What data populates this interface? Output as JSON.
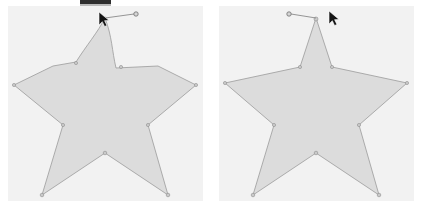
{
  "app": {
    "title": "Shape Editor Comparison",
    "panel_count": 2
  },
  "top_bar": {
    "name": "toolbar-strip",
    "color": "#2e2e2e",
    "label": ""
  },
  "colors": {
    "canvas_background": "#f2f2f2",
    "page_background": "#ffffff",
    "shape_fill": "#dcdcdc",
    "shape_stroke": "#9a9a9a",
    "vertex_fill": "#c9c9c9",
    "vertex_stroke": "#8e8e8e",
    "handle_stroke": "#8a8a8a",
    "cursor_fill": "#141414",
    "toolbar_dark": "#2e2e2e"
  },
  "panels": [
    {
      "id": "left",
      "name": "canvas-left",
      "label": "Before",
      "x": 8,
      "y": 6,
      "width": 195,
      "height": 195,
      "shape": {
        "name": "star-polygon",
        "type": "star",
        "points": 5,
        "top_point_style": "rounded",
        "fill": "#dcdcdc",
        "stroke": "#9a9a9a",
        "path": "M 97 12 C 104 30 104 45 108 62 L 150 60 L 188 79 L 140 119 L 160 189 L 97 147 L 34 189 L 55 119 L 6 79 L 45 60 L 68 56 C 78 40 90 26 97 12 Z",
        "vertices": [
          {
            "name": "vertex-top",
            "x": 97,
            "y": 13
          },
          {
            "name": "vertex-inner-upper-right",
            "x": 113,
            "y": 61
          },
          {
            "name": "vertex-outer-right",
            "x": 188,
            "y": 79
          },
          {
            "name": "vertex-inner-lower-right",
            "x": 140,
            "y": 119
          },
          {
            "name": "vertex-outer-bottom-right",
            "x": 160,
            "y": 189
          },
          {
            "name": "vertex-inner-bottom",
            "x": 97,
            "y": 147
          },
          {
            "name": "vertex-outer-bottom-left",
            "x": 34,
            "y": 189
          },
          {
            "name": "vertex-inner-lower-left",
            "x": 55,
            "y": 119
          },
          {
            "name": "vertex-outer-left",
            "x": 6,
            "y": 79
          },
          {
            "name": "vertex-inner-upper-left",
            "x": 68,
            "y": 57
          }
        ]
      },
      "rotation_handle": {
        "name": "rotation-handle-left",
        "direction": "right",
        "anchor_x": 97,
        "anchor_y": 12,
        "end_x": 128,
        "end_y": 8
      },
      "cursor": {
        "name": "rotate-cursor",
        "x": 95,
        "y": 10,
        "glyph": "arrow-pointer"
      }
    },
    {
      "id": "right",
      "name": "canvas-right",
      "label": "After",
      "x": 219,
      "y": 6,
      "width": 195,
      "height": 195,
      "shape": {
        "name": "star-polygon",
        "type": "star",
        "points": 5,
        "top_point_style": "sharp",
        "fill": "#dcdcdc",
        "stroke": "#9a9a9a",
        "path": "M 97 12 L 113 61 L 188 77 L 140 119 L 160 189 L 97 147 L 34 189 L 55 119 L 6 77 L 81 61 Z",
        "vertices": [
          {
            "name": "vertex-top",
            "x": 97,
            "y": 13
          },
          {
            "name": "vertex-inner-upper-right",
            "x": 113,
            "y": 61
          },
          {
            "name": "vertex-outer-right",
            "x": 188,
            "y": 77
          },
          {
            "name": "vertex-inner-lower-right",
            "x": 140,
            "y": 119
          },
          {
            "name": "vertex-outer-bottom-right",
            "x": 160,
            "y": 189
          },
          {
            "name": "vertex-inner-bottom",
            "x": 97,
            "y": 147
          },
          {
            "name": "vertex-outer-bottom-left",
            "x": 34,
            "y": 189
          },
          {
            "name": "vertex-inner-lower-left",
            "x": 55,
            "y": 119
          },
          {
            "name": "vertex-outer-left",
            "x": 6,
            "y": 77
          },
          {
            "name": "vertex-inner-upper-left",
            "x": 81,
            "y": 61
          }
        ]
      },
      "rotation_handle": {
        "name": "rotation-handle-right",
        "direction": "left",
        "anchor_x": 97,
        "anchor_y": 12,
        "end_x": 70,
        "end_y": 8
      },
      "cursor": {
        "name": "rotate-cursor",
        "x": 113,
        "y": 10,
        "glyph": "arrow-pointer"
      }
    }
  ]
}
